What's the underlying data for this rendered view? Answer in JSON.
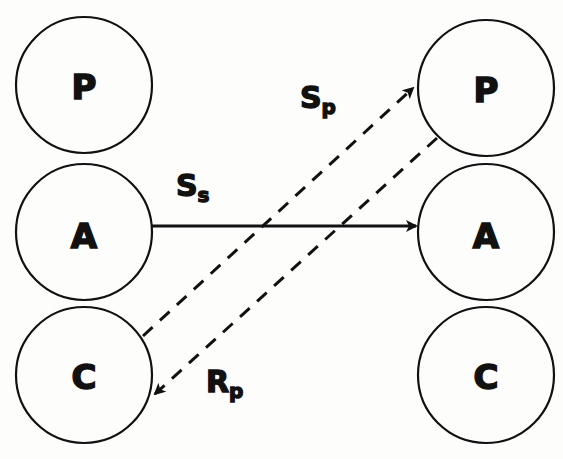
{
  "diagram": {
    "left_stack": {
      "nodes": [
        {
          "label": "P",
          "cx": 84,
          "cy": 85,
          "r": 68
        },
        {
          "label": "A",
          "cx": 84,
          "cy": 232,
          "r": 68
        },
        {
          "label": "C",
          "cx": 84,
          "cy": 375,
          "r": 68
        }
      ]
    },
    "right_stack": {
      "nodes": [
        {
          "label": "P",
          "cx": 486,
          "cy": 88,
          "r": 68
        },
        {
          "label": "A",
          "cx": 486,
          "cy": 232,
          "r": 68
        },
        {
          "label": "C",
          "cx": 486,
          "cy": 375,
          "r": 68
        }
      ]
    },
    "arrows": [
      {
        "id": "ss",
        "label_main": "S",
        "label_sub": "s",
        "style": "solid",
        "from": "left.A",
        "to": "right.A"
      },
      {
        "id": "sp",
        "label_main": "S",
        "label_sub": "p",
        "style": "dashed",
        "from": "left.C",
        "to": "right.P"
      },
      {
        "id": "rp",
        "label_main": "R",
        "label_sub": "p",
        "style": "dashed",
        "from": "right.P",
        "to": "left.C"
      }
    ],
    "colors": {
      "stroke": "#111111",
      "background": "#fdfdfc"
    }
  }
}
